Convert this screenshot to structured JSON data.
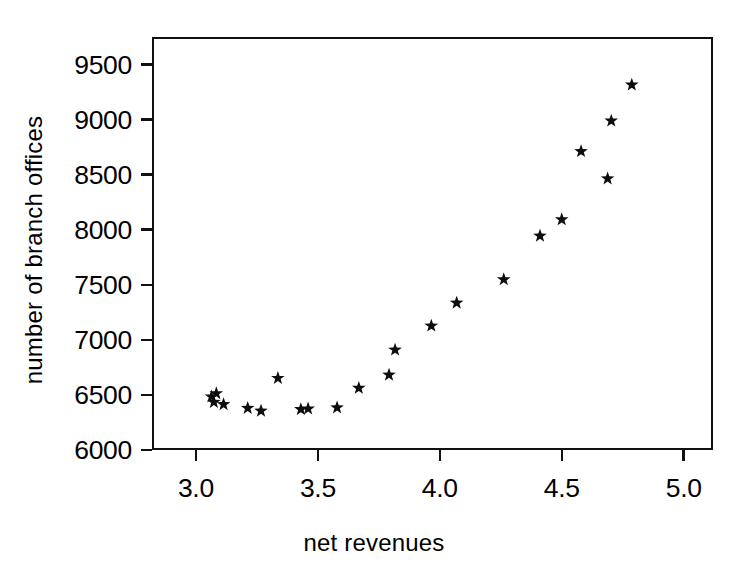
{
  "chart_data": {
    "type": "scatter",
    "title": "",
    "xlabel": "net revenues",
    "ylabel": "number of branch offices",
    "xlim": [
      2.82,
      5.12
    ],
    "ylim": [
      6000,
      9750
    ],
    "xticks": [
      "3.0",
      "3.5",
      "4.0",
      "4.5",
      "5.0"
    ],
    "xtick_values": [
      3.0,
      3.5,
      4.0,
      4.5,
      5.0
    ],
    "yticks": [
      "6000",
      "6500",
      "7000",
      "7500",
      "8000",
      "8500",
      "9000",
      "9500"
    ],
    "ytick_values": [
      6000,
      6500,
      7000,
      7500,
      8000,
      8500,
      9000,
      9500
    ],
    "grid": false,
    "legend": null,
    "marker": "star",
    "marker_color": "#0d0d0d",
    "points": [
      {
        "x": 3.055,
        "y": 6470
      },
      {
        "x": 3.065,
        "y": 6420
      },
      {
        "x": 3.075,
        "y": 6500
      },
      {
        "x": 3.105,
        "y": 6400
      },
      {
        "x": 3.205,
        "y": 6365
      },
      {
        "x": 3.26,
        "y": 6340
      },
      {
        "x": 3.33,
        "y": 6640
      },
      {
        "x": 3.425,
        "y": 6355
      },
      {
        "x": 3.455,
        "y": 6360
      },
      {
        "x": 3.575,
        "y": 6370
      },
      {
        "x": 3.665,
        "y": 6550
      },
      {
        "x": 3.79,
        "y": 6670
      },
      {
        "x": 3.815,
        "y": 6900
      },
      {
        "x": 3.965,
        "y": 7120
      },
      {
        "x": 4.07,
        "y": 7330
      },
      {
        "x": 4.265,
        "y": 7545
      },
      {
        "x": 4.415,
        "y": 7945
      },
      {
        "x": 4.505,
        "y": 8095
      },
      {
        "x": 4.585,
        "y": 8720
      },
      {
        "x": 4.695,
        "y": 8470
      },
      {
        "x": 4.71,
        "y": 9000
      },
      {
        "x": 4.795,
        "y": 9330
      }
    ]
  }
}
